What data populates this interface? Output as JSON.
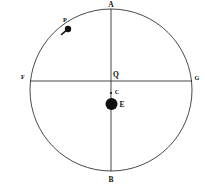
{
  "figure": {
    "type": "geometric-diagram",
    "background_color": "#ffffff",
    "stroke_color": "#1a1a1a",
    "label_color": "#111111"
  },
  "circle": {
    "name": "deferent-circle",
    "center_x": 111,
    "center_y": 90,
    "radius": 81,
    "stroke_width": 0.8
  },
  "lines": [
    {
      "name": "vertical-diameter",
      "from": "A",
      "to": "B",
      "x1": 111,
      "y1": 9,
      "x2": 111,
      "y2": 171
    },
    {
      "name": "horizontal-diameter",
      "from": "F",
      "to": "G",
      "x1": 30,
      "y1": 81,
      "x2": 192,
      "y2": 81
    }
  ],
  "points": [
    {
      "name": "point-a",
      "label": "A",
      "x": 111,
      "y": 9,
      "label_x": 111,
      "label_y": 5,
      "marker": "none"
    },
    {
      "name": "point-b",
      "label": "B",
      "x": 111,
      "y": 171,
      "label_x": 111,
      "label_y": 180,
      "marker": "none"
    },
    {
      "name": "point-f",
      "label": "F",
      "x": 30,
      "y": 81,
      "label_x": 23,
      "label_y": 78,
      "marker": "none"
    },
    {
      "name": "point-g",
      "label": "G",
      "x": 192,
      "y": 81,
      "label_x": 197,
      "label_y": 79,
      "marker": "none"
    },
    {
      "name": "point-q-equant",
      "label": "Q",
      "x": 111,
      "y": 81,
      "label_x": 116,
      "label_y": 75,
      "marker": "none"
    },
    {
      "name": "point-c-center",
      "label": "C",
      "x": 111,
      "y": 93,
      "label_x": 117,
      "label_y": 93,
      "marker": "small-dot",
      "marker_radius": 1.1
    },
    {
      "name": "point-e-earth",
      "label": "E",
      "x": 111.5,
      "y": 104,
      "label_x": 122,
      "label_y": 105,
      "marker": "large-dot",
      "marker_radius": 6
    },
    {
      "name": "point-p-planet",
      "label": "P",
      "x": 68,
      "y": 29,
      "label_x": 65,
      "label_y": 21,
      "marker": "medium-dot",
      "marker_radius": 3.2
    }
  ],
  "tick": {
    "name": "arc-tick-mark",
    "x1": 61.5,
    "y1": 34.5,
    "x2": 65.2,
    "y2": 31.3,
    "stroke_width": 1.6
  },
  "labels_text": {
    "a": "A",
    "b": "B",
    "f": "F",
    "g": "G",
    "q": "Q",
    "c": "C",
    "e": "E",
    "p": "P"
  }
}
